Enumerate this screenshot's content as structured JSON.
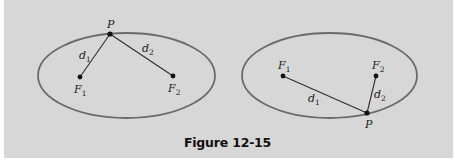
{
  "figure": {
    "caption": "Figure 12-15",
    "background_color": "#d7d7d7",
    "ellipse_stroke_color": "#6a6a6a",
    "segment_color": "#2e2e2e",
    "point_color": "#111111"
  },
  "diagrams": [
    {
      "id": "left",
      "description": "Ellipse with point P at top, segments to foci",
      "ellipse": {
        "cx": 126.5,
        "cy": 75.5,
        "rx": 88.5,
        "ry": 42.5
      },
      "points": {
        "P": {
          "label": "P",
          "x": 110,
          "y": 34
        },
        "F1": {
          "label": "F",
          "sub": "1",
          "x": 80,
          "y": 77
        },
        "F2": {
          "label": "F",
          "sub": "2",
          "x": 173,
          "y": 76
        }
      },
      "segments": [
        {
          "label": "d",
          "sub": "1",
          "from": "P",
          "to": "F1"
        },
        {
          "label": "d",
          "sub": "2",
          "from": "P",
          "to": "F2"
        }
      ]
    },
    {
      "id": "right",
      "description": "Ellipse with point P at bottom right, segments to foci",
      "ellipse": {
        "cx": 329.5,
        "cy": 75.5,
        "rx": 87.5,
        "ry": 42.5
      },
      "points": {
        "P": {
          "label": "P",
          "x": 367,
          "y": 113
        },
        "F1": {
          "label": "F",
          "sub": "1",
          "x": 283,
          "y": 76
        },
        "F2": {
          "label": "F",
          "sub": "2",
          "x": 376,
          "y": 76
        }
      },
      "segments": [
        {
          "label": "d",
          "sub": "1",
          "from": "P",
          "to": "F1"
        },
        {
          "label": "d",
          "sub": "2",
          "from": "P",
          "to": "F2"
        }
      ]
    }
  ]
}
